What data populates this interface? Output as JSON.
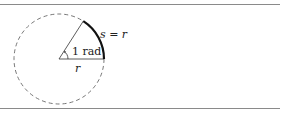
{
  "diagram": {
    "labels": {
      "arc": "s = r",
      "angle": "1 rad",
      "radius": "r"
    },
    "geometry": {
      "center": [
        59,
        59
      ],
      "radius": 45,
      "angle_rad": 1
    },
    "colors": {
      "rule": "#8a8a8a",
      "stroke": "#333333",
      "arc": "#111111",
      "dashed_circle": "#555555"
    }
  }
}
